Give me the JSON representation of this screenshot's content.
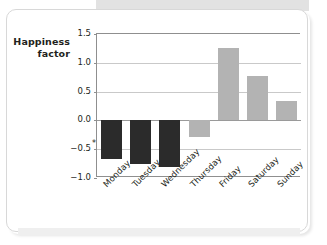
{
  "chart_data": {
    "type": "bar",
    "title": "",
    "subtitle": "",
    "xlabel": "",
    "ylabel": "Happiness factor",
    "ylabel_line1": "Happiness",
    "ylabel_line2": "factor",
    "categories": [
      "Monday",
      "Tuesday",
      "Wednesday",
      "Thursday",
      "Friday",
      "Saturday",
      "Sunday"
    ],
    "values": [
      -0.67,
      -0.75,
      -0.81,
      -0.28,
      1.25,
      0.77,
      0.33
    ],
    "bar_colors": [
      "#2b2b2b",
      "#2b2b2b",
      "#2b2b2b",
      "#b3b3b3",
      "#b3b3b3",
      "#b3b3b3",
      "#b3b3b3"
    ],
    "ylim": [
      -1.0,
      1.5
    ],
    "yticks": [
      1.5,
      1.0,
      0.5,
      0.0,
      -0.5,
      -1.0
    ],
    "ytick_labels": [
      "1.5",
      "1.0",
      "0.5",
      "0.0",
      "-0.5",
      "-1.0"
    ],
    "grid": true,
    "grid_axis": "y",
    "legend": false,
    "legend_position": "none",
    "annotations": [
      {
        "text": "*",
        "x": "Monday",
        "y": -0.4,
        "placement": "left-of-bar"
      }
    ],
    "xtick_rotation": -45
  },
  "style": {
    "axis_color": "#8f8f8f",
    "grid_color": "#c9c9c9",
    "zero_line_color": "#9a9a9a",
    "dark_bar_color": "#2b2b2b",
    "gray_bar_color": "#b3b3b3",
    "text_color": "#231f20",
    "card_background": "#ffffff",
    "card_border": "#d8d8d8",
    "band_color": "#e2e2e2"
  }
}
